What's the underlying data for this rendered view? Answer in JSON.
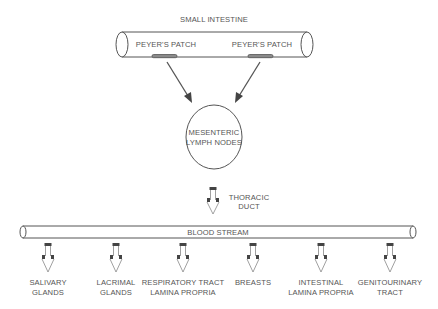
{
  "diagram": {
    "title": "SMALL INTESTINE",
    "patches": [
      {
        "label": "PEYER'S PATCH"
      },
      {
        "label": "PEYER'S PATCH"
      }
    ],
    "node": {
      "line1": "MESENTERIC",
      "line2": "LYMPH NODES"
    },
    "duct": {
      "line1": "THORACIC",
      "line2": "DUCT"
    },
    "bloodstream": "BLOOD STREAM",
    "destinations": [
      {
        "line1": "SALIVARY",
        "line2": "GLANDS"
      },
      {
        "line1": "LACRIMAL",
        "line2": "GLANDS"
      },
      {
        "line1": "RESPIRATORY TRACT",
        "line2": "LAMINA PROPRIA"
      },
      {
        "line1": "BREASTS",
        "line2": ""
      },
      {
        "line1": "INTESTINAL",
        "line2": "LAMINA PROPRIA"
      },
      {
        "line1": "GENITOURINARY",
        "line2": "TRACT"
      }
    ]
  },
  "colors": {
    "stroke": "#555555",
    "text": "#555555",
    "fill": "#ffffff"
  }
}
